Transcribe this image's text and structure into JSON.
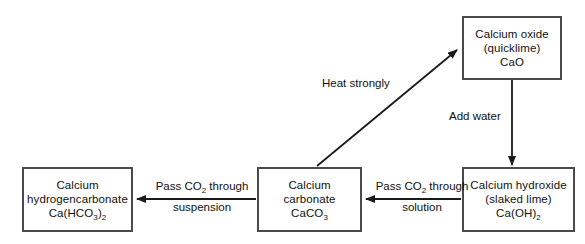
{
  "diagram": {
    "colors": {
      "background": "#ffffff",
      "box_border": "#4a4a4a",
      "arrow": "#1a1a1a",
      "text": "#111111"
    },
    "nodes": [
      {
        "id": "calcium-oxide",
        "name": "Calcium oxide",
        "alias": "(quicklime)",
        "formula_text": "CaO",
        "formula_parts": [
          {
            "t": "CaO",
            "sub": false
          }
        ]
      },
      {
        "id": "calcium-hydroxide",
        "name": "Calcium hydroxide",
        "alias": "(slaked lime)",
        "formula_text": "Ca(OH)2",
        "formula_parts": [
          {
            "t": "Ca(OH)",
            "sub": false
          },
          {
            "t": "2",
            "sub": true
          }
        ]
      },
      {
        "id": "calcium-carbonate",
        "name_line1": "Calcium",
        "name_line2": "carbonate",
        "formula_text": "CaCO3",
        "formula_parts": [
          {
            "t": "CaCO",
            "sub": false
          },
          {
            "t": "3",
            "sub": true
          }
        ]
      },
      {
        "id": "calcium-hydrogencarbonate",
        "name_line1": "Calcium",
        "name_line2": "hydrogencarbonate",
        "formula_text": "Ca(HCO3)2",
        "formula_parts": [
          {
            "t": "Ca(HCO",
            "sub": false
          },
          {
            "t": "3",
            "sub": true
          },
          {
            "t": ")",
            "sub": false
          },
          {
            "t": "2",
            "sub": true
          }
        ]
      }
    ],
    "edges": [
      {
        "id": "heat-strongly",
        "from": "calcium-carbonate",
        "to": "calcium-oxide",
        "label_top": "Heat strongly",
        "label_bottom": "",
        "direction": "diagonal-up-right"
      },
      {
        "id": "add-water",
        "from": "calcium-oxide",
        "to": "calcium-hydroxide",
        "label_top": "Add water",
        "label_bottom": "",
        "direction": "down"
      },
      {
        "id": "pass-co2-solution",
        "from": "calcium-hydroxide",
        "to": "calcium-carbonate",
        "label_top": "Pass CO2 through",
        "label_top_parts": [
          {
            "t": "Pass CO",
            "sub": false
          },
          {
            "t": "2",
            "sub": true
          },
          {
            "t": " through",
            "sub": false
          }
        ],
        "label_bottom": "solution",
        "direction": "left"
      },
      {
        "id": "pass-co2-suspension",
        "from": "calcium-carbonate",
        "to": "calcium-hydrogencarbonate",
        "label_top": "Pass CO2 through",
        "label_top_parts": [
          {
            "t": "Pass CO",
            "sub": false
          },
          {
            "t": "2",
            "sub": true
          },
          {
            "t": " through",
            "sub": false
          }
        ],
        "label_bottom": "suspension",
        "direction": "left"
      }
    ]
  }
}
